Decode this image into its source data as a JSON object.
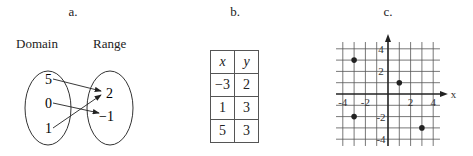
{
  "panels": {
    "a": {
      "label": "a.",
      "domain_title": "Domain",
      "range_title": "Range",
      "domain": [
        "5",
        "0",
        "1"
      ],
      "range": [
        "2",
        "−1"
      ],
      "mappings": [
        {
          "from": "5",
          "to": "2"
        },
        {
          "from": "0",
          "to": "−1"
        },
        {
          "from": "1",
          "to": "2"
        }
      ]
    },
    "b": {
      "label": "b.",
      "headers": [
        "x",
        "y"
      ],
      "rows": [
        [
          "−3",
          "2"
        ],
        [
          "1",
          "3"
        ],
        [
          "5",
          "3"
        ]
      ]
    },
    "c": {
      "label": "c.",
      "x_axis_label": "x",
      "x_ticks": [
        "-4",
        "-2",
        "2",
        "4"
      ],
      "y_ticks": [
        "4",
        "2",
        "-2",
        "-4"
      ],
      "points": [
        [
          -3,
          3
        ],
        [
          1,
          1
        ],
        [
          -3,
          -2
        ],
        [
          3,
          -3
        ]
      ]
    }
  },
  "chart_data": {
    "type": "scatter",
    "title": "c.",
    "xlabel": "x",
    "ylabel": "",
    "xlim": [
      -4,
      4
    ],
    "ylim": [
      -4,
      4
    ],
    "grid": true,
    "x": [
      -3,
      1,
      -3,
      3
    ],
    "y": [
      3,
      1,
      -2,
      -3
    ]
  }
}
